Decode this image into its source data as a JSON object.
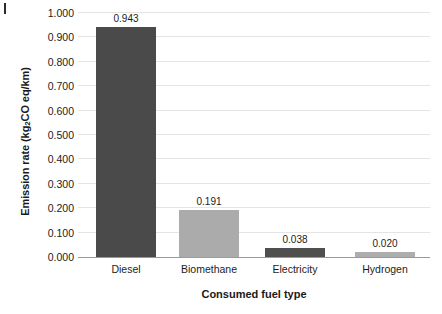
{
  "chart_data": {
    "type": "bar",
    "title": "",
    "xlabel": "Consumed fuel type",
    "ylabel": "Emission rate (kg2CO eq/km)",
    "ylabel_parts": {
      "before": "Emission rate (kg",
      "sub": "2",
      "after": "CO eq/km)"
    },
    "categories": [
      "Diesel",
      "Biomethane",
      "Electricity",
      "Hydrogen"
    ],
    "values": [
      0.943,
      0.191,
      0.038,
      0.02
    ],
    "value_labels": [
      "0.943",
      "0.191",
      "0.038",
      "0.020"
    ],
    "bar_colors": [
      "#4a4a4a",
      "#ababab",
      "#4f4f4f",
      "#adadad"
    ],
    "ylim": [
      0.0,
      1.0
    ],
    "yticks": [
      0.0,
      0.1,
      0.2,
      0.3,
      0.4,
      0.5,
      0.6,
      0.7,
      0.8,
      0.9,
      1.0
    ],
    "ytick_labels": [
      "0.000",
      "0.100",
      "0.200",
      "0.300",
      "0.400",
      "0.500",
      "0.600",
      "0.700",
      "0.800",
      "0.900",
      "1.000"
    ],
    "grid": true,
    "grid_axis": "y",
    "grid_color": "#e4e4e4",
    "legend": false,
    "legend_position": "none",
    "bar_width_px": 60,
    "bar_centers_px": [
      48,
      131,
      217,
      307
    ]
  }
}
